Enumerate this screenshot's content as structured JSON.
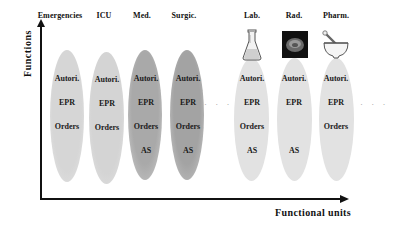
{
  "diagram": {
    "y_axis_label": "Functions",
    "x_axis_label": "Functional units",
    "ellipsis_middle": "· · ·",
    "ellipsis_end": "· · ·",
    "units": [
      {
        "name": "Emergencies",
        "functions": [
          "Autori.",
          "EPR",
          "Orders"
        ],
        "fill": "#d9d9d9",
        "icon": null
      },
      {
        "name": "ICU",
        "functions": [
          "Autori.",
          "EPR",
          "Orders"
        ],
        "fill": "#d6d6d6",
        "icon": null
      },
      {
        "name": "Med.",
        "functions": [
          "Autori.",
          "EPR",
          "Orders",
          "AS"
        ],
        "fill": "#b4b4b4",
        "icon": null
      },
      {
        "name": "Surgic.",
        "functions": [
          "Autori.",
          "EPR",
          "Orders",
          "AS"
        ],
        "fill": "#acacac",
        "icon": null
      },
      {
        "name": "Lab.",
        "functions": [
          "Autori.",
          "EPR",
          "Orders",
          "AS"
        ],
        "fill": "#e3e3e3",
        "icon": "flask-icon"
      },
      {
        "name": "Rad.",
        "functions": [
          "Autori.",
          "EPR",
          "AS"
        ],
        "fill": "#e3e3e3",
        "icon": "radiology-scan-icon"
      },
      {
        "name": "Pharm.",
        "functions": [
          "Autori.",
          "EPR",
          "Orders"
        ],
        "fill": "#e3e3e3",
        "icon": "mortar-pestle-icon"
      }
    ]
  }
}
